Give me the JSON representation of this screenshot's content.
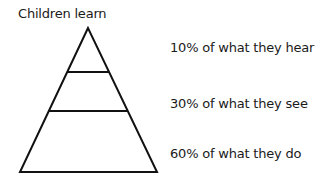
{
  "diagram": {
    "title": "Children learn",
    "shape": "pyramid",
    "tiers": [
      {
        "label": "10% of what they hear",
        "percent": 10
      },
      {
        "label": "30% of what they see",
        "percent": 30
      },
      {
        "label": "60% of what they do",
        "percent": 60
      }
    ],
    "stroke_color": "#111111"
  }
}
